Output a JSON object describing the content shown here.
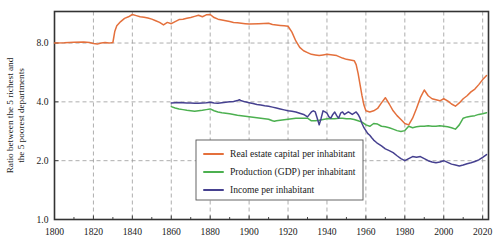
{
  "chart_data": {
    "type": "line",
    "title": "",
    "subtitle": "",
    "xlabel": "",
    "ylabel_line1": "Ratio between the 5 richest and",
    "ylabel_line2": "the 5 poorest departments",
    "yscale": "log2",
    "xlim": [
      1800,
      2023
    ],
    "ylim": [
      1.0,
      11.6
    ],
    "grid": true,
    "legend_position": "lower center",
    "xticks": [
      1800,
      1820,
      1840,
      1860,
      1880,
      1900,
      1920,
      1940,
      1960,
      1980,
      2000,
      2020
    ],
    "xtick_labels": [
      "1800",
      "1820",
      "1840",
      "1860",
      "1880",
      "1900",
      "1920",
      "1940",
      "1960",
      "1980",
      "2000",
      "2020"
    ],
    "xminor_step": 10,
    "yticks": [
      1.0,
      2.0,
      4.0,
      8.0
    ],
    "ytick_labels": [
      "1.0",
      "2.0",
      "4.0",
      "8.0"
    ],
    "colors": {
      "real_estate": "#E4703C",
      "production": "#4CB050",
      "income": "#464190",
      "grid": "#999999",
      "axis": "#333333"
    },
    "series": [
      {
        "name": "Real estate capital per inhabitant",
        "key": "real_estate",
        "color": "#E4703C",
        "x": [
          1800,
          1805,
          1810,
          1815,
          1818,
          1820,
          1822,
          1824,
          1826,
          1828,
          1829,
          1830,
          1831,
          1832,
          1834,
          1836,
          1838,
          1840,
          1842,
          1844,
          1846,
          1848,
          1850,
          1852,
          1854,
          1856,
          1858,
          1860,
          1862,
          1864,
          1866,
          1868,
          1870,
          1872,
          1874,
          1876,
          1878,
          1880,
          1882,
          1884,
          1886,
          1888,
          1890,
          1892,
          1894,
          1896,
          1898,
          1900,
          1905,
          1910,
          1912,
          1914,
          1916,
          1918,
          1920,
          1922,
          1924,
          1926,
          1928,
          1930,
          1932,
          1934,
          1936,
          1938,
          1940,
          1945,
          1948,
          1950,
          1952,
          1954,
          1955,
          1956,
          1957,
          1958,
          1959,
          1960,
          1962,
          1964,
          1966,
          1968,
          1970,
          1972,
          1974,
          1976,
          1978,
          1980,
          1982,
          1984,
          1986,
          1988,
          1990,
          1992,
          1994,
          1996,
          1998,
          2000,
          2002,
          2004,
          2006,
          2008,
          2010,
          2012,
          2014,
          2016,
          2018,
          2020,
          2022
        ],
        "y": [
          8.0,
          8.02,
          8.08,
          8.1,
          8.05,
          7.95,
          7.9,
          8.0,
          8.05,
          8.0,
          8.02,
          8.05,
          9.2,
          9.8,
          10.3,
          10.7,
          10.9,
          11.2,
          11.05,
          10.9,
          10.85,
          10.75,
          10.6,
          10.4,
          10.2,
          9.9,
          10.2,
          10.05,
          10.3,
          10.55,
          10.6,
          10.7,
          10.8,
          10.95,
          11.1,
          10.9,
          11.15,
          11.2,
          10.8,
          10.6,
          10.5,
          10.4,
          10.3,
          10.2,
          10.15,
          10.1,
          10.05,
          10.0,
          10.05,
          10.1,
          9.95,
          9.9,
          9.85,
          9.8,
          9.75,
          9.1,
          8.2,
          7.6,
          7.3,
          7.15,
          7.0,
          6.95,
          6.9,
          6.95,
          7.0,
          6.9,
          6.7,
          6.6,
          6.55,
          6.5,
          6.2,
          5.6,
          4.9,
          4.3,
          3.85,
          3.6,
          3.55,
          3.6,
          3.7,
          3.95,
          4.2,
          3.9,
          3.6,
          3.4,
          3.25,
          3.1,
          3.05,
          3.3,
          3.7,
          4.2,
          4.6,
          4.3,
          4.15,
          4.1,
          4.05,
          4.15,
          4.05,
          3.9,
          3.8,
          3.95,
          4.15,
          4.3,
          4.5,
          4.65,
          4.9,
          5.2,
          5.45
        ]
      },
      {
        "name": "Production (GDP) per inhabitant",
        "key": "production",
        "color": "#4CB050",
        "x": [
          1860,
          1862,
          1864,
          1866,
          1868,
          1870,
          1872,
          1874,
          1876,
          1878,
          1880,
          1882,
          1884,
          1886,
          1888,
          1890,
          1892,
          1894,
          1896,
          1898,
          1900,
          1902,
          1904,
          1906,
          1908,
          1910,
          1912,
          1913,
          1914,
          1916,
          1918,
          1920,
          1922,
          1924,
          1926,
          1928,
          1930,
          1932,
          1934,
          1936,
          1938,
          1940,
          1942,
          1944,
          1946,
          1948,
          1950,
          1952,
          1954,
          1956,
          1958,
          1960,
          1962,
          1964,
          1966,
          1968,
          1970,
          1972,
          1974,
          1976,
          1978,
          1980,
          1982,
          1984,
          1986,
          1988,
          1990,
          1992,
          1994,
          1996,
          1998,
          2000,
          2002,
          2004,
          2006,
          2008,
          2010,
          2012,
          2014,
          2016,
          2018,
          2020,
          2022
        ],
        "y": [
          3.78,
          3.72,
          3.68,
          3.65,
          3.62,
          3.6,
          3.58,
          3.6,
          3.62,
          3.65,
          3.68,
          3.6,
          3.55,
          3.52,
          3.5,
          3.48,
          3.45,
          3.42,
          3.4,
          3.38,
          3.36,
          3.34,
          3.32,
          3.3,
          3.28,
          3.26,
          3.2,
          3.18,
          3.2,
          3.22,
          3.24,
          3.26,
          3.28,
          3.3,
          3.3,
          3.3,
          3.3,
          3.2,
          3.2,
          3.22,
          3.25,
          3.28,
          3.28,
          3.28,
          3.3,
          3.3,
          3.28,
          3.28,
          3.25,
          3.2,
          3.15,
          3.05,
          3.0,
          3.1,
          3.08,
          3.0,
          2.98,
          2.95,
          2.9,
          2.85,
          2.82,
          2.85,
          3.0,
          2.95,
          2.98,
          3.0,
          3.0,
          3.02,
          3.0,
          3.0,
          3.02,
          3.0,
          2.98,
          2.95,
          2.9,
          3.05,
          3.3,
          3.35,
          3.38,
          3.4,
          3.45,
          3.48,
          3.52
        ]
      },
      {
        "name": "Income per inhabitant",
        "key": "income",
        "color": "#464190",
        "x": [
          1860,
          1862,
          1864,
          1866,
          1868,
          1870,
          1872,
          1874,
          1876,
          1878,
          1880,
          1882,
          1884,
          1886,
          1888,
          1890,
          1892,
          1894,
          1895,
          1896,
          1898,
          1900,
          1902,
          1904,
          1906,
          1908,
          1910,
          1912,
          1914,
          1916,
          1918,
          1920,
          1922,
          1924,
          1926,
          1928,
          1929,
          1930,
          1931,
          1932,
          1933,
          1934,
          1935,
          1936,
          1937,
          1938,
          1939,
          1940,
          1941,
          1942,
          1943,
          1944,
          1945,
          1946,
          1947,
          1948,
          1949,
          1950,
          1951,
          1952,
          1953,
          1954,
          1955,
          1956,
          1957,
          1958,
          1959,
          1960,
          1961,
          1962,
          1963,
          1964,
          1965,
          1966,
          1968,
          1970,
          1972,
          1974,
          1976,
          1978,
          1980,
          1982,
          1984,
          1986,
          1988,
          1990,
          1992,
          1994,
          1996,
          1998,
          2000,
          2002,
          2004,
          2006,
          2008,
          2010,
          2012,
          2014,
          2016,
          2018,
          2020,
          2022
        ],
        "y": [
          3.95,
          3.96,
          3.97,
          3.96,
          3.95,
          3.95,
          3.94,
          3.93,
          3.95,
          3.96,
          3.98,
          3.95,
          3.94,
          3.96,
          3.98,
          4.0,
          4.02,
          4.06,
          4.1,
          4.05,
          4.0,
          3.96,
          3.92,
          3.88,
          3.85,
          3.82,
          3.8,
          3.76,
          3.72,
          3.68,
          3.64,
          3.6,
          3.58,
          3.55,
          3.5,
          3.45,
          3.4,
          3.35,
          3.45,
          3.55,
          3.6,
          3.55,
          3.3,
          3.05,
          3.3,
          3.6,
          3.55,
          3.5,
          3.35,
          3.3,
          3.45,
          3.55,
          3.4,
          3.3,
          3.5,
          3.55,
          3.45,
          3.5,
          3.55,
          3.5,
          3.45,
          3.5,
          3.55,
          3.45,
          3.3,
          3.1,
          2.95,
          2.85,
          2.75,
          2.7,
          2.62,
          2.55,
          2.5,
          2.45,
          2.38,
          2.3,
          2.25,
          2.2,
          2.12,
          2.05,
          2.0,
          2.05,
          2.1,
          2.08,
          2.1,
          2.05,
          2.0,
          1.97,
          1.95,
          1.97,
          2.0,
          1.96,
          1.92,
          1.9,
          1.88,
          1.9,
          1.93,
          1.95,
          1.98,
          2.02,
          2.08,
          2.15
        ]
      }
    ],
    "legend_entries": [
      {
        "label": "Real estate capital per inhabitant",
        "color": "#E4703C"
      },
      {
        "label": "Production (GDP) per inhabitant",
        "color": "#4CB050"
      },
      {
        "label": "Income per inhabitant",
        "color": "#464190"
      }
    ]
  }
}
